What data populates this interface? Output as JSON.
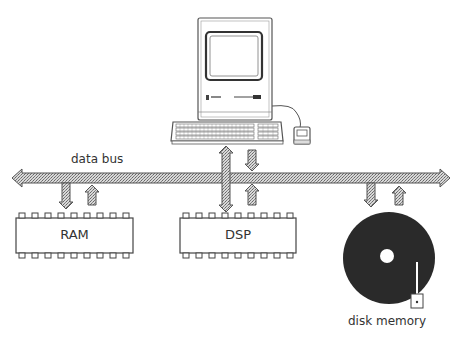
{
  "diagram": {
    "bus": {
      "label": "data bus",
      "fill_color": "#b8b8b8",
      "stroke_color": "#555555"
    },
    "components": [
      {
        "id": "computer",
        "label": ""
      },
      {
        "id": "ram",
        "label": "RAM"
      },
      {
        "id": "dsp",
        "label": "DSP"
      },
      {
        "id": "disk",
        "label": "disk memory",
        "fill_color": "#2a2a2a"
      }
    ],
    "computer_badge": "Mac"
  }
}
